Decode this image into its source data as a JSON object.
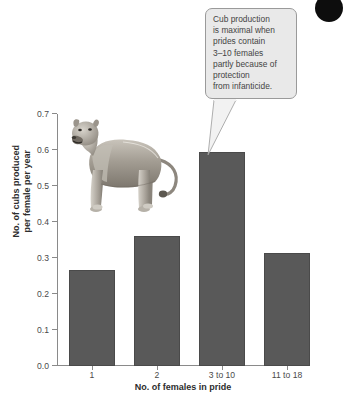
{
  "chart_data": {
    "type": "bar",
    "title": "",
    "xlabel": "No. of females in pride",
    "ylabel_line1": "No. of cubs produced",
    "ylabel_line2": "per female per year",
    "categories": [
      "1",
      "2",
      "3 to 10",
      "11 to 18"
    ],
    "values": [
      0.267,
      0.361,
      0.595,
      0.315
    ],
    "ylim": [
      0.0,
      0.7
    ],
    "ytick_labels": [
      "0.0",
      "0.1",
      "0.2",
      "0.3",
      "0.4",
      "0.5",
      "0.6",
      "0.7"
    ],
    "ytick_values": [
      0.0,
      0.1,
      0.2,
      0.3,
      0.4,
      0.5,
      0.6,
      0.7
    ],
    "grid": false,
    "legend": "none",
    "bar_color": "#595959",
    "axis_color": "#8a8a8a"
  },
  "annotation": {
    "lines": [
      "Cub production",
      "is maximal when",
      "prides contain",
      "3–10 females",
      "partly because of",
      "protection",
      "from infanticide."
    ],
    "background": "#e9e9e9",
    "border": "#9a9a9a",
    "points_to_category": "3 to 10"
  },
  "illustration": {
    "name": "lioness-illustration",
    "alt": "Grayscale illustration of a standing lioness"
  },
  "corner_marker": {
    "shape": "filled-circle",
    "color": "#0d0d0d"
  },
  "caption": {
    "text": ""
  }
}
